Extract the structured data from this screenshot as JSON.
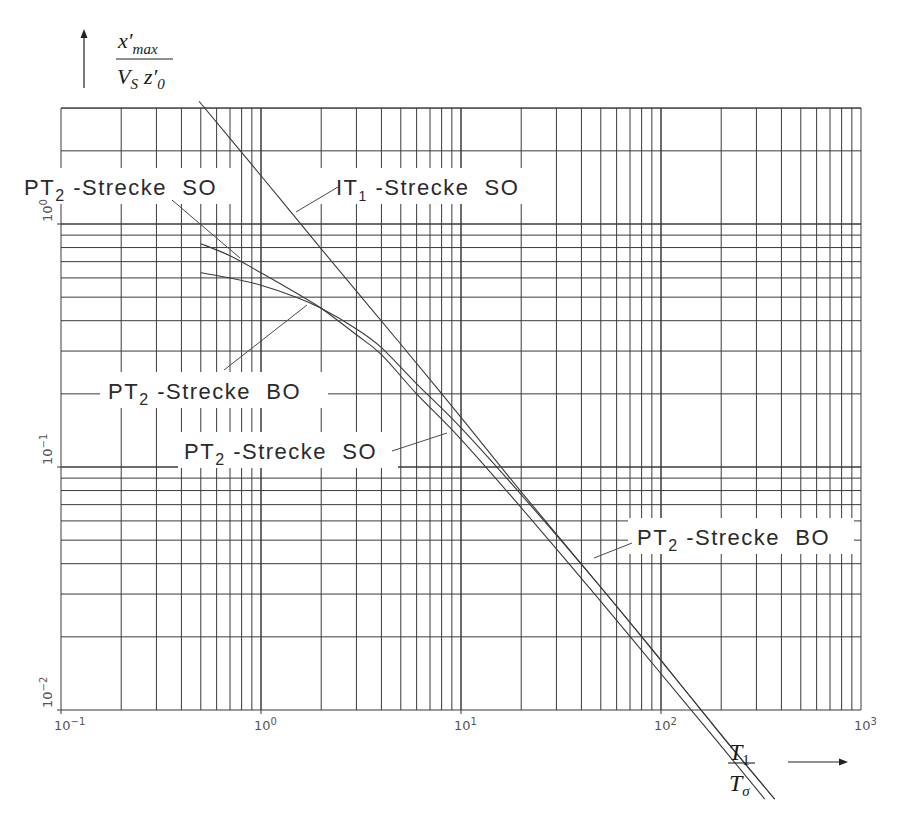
{
  "chart_data": {
    "type": "line",
    "title": "",
    "xscale": "log",
    "yscale": "log",
    "xlim": [
      0.1,
      1000
    ],
    "ylim": [
      0.01,
      3
    ],
    "grid": true,
    "xlabel": "T1 / Tσ",
    "ylabel": "x'max / (VS z'0)",
    "xlabel_parts": {
      "num": "T",
      "num_sub": "1",
      "den": "T",
      "den_sub": "σ"
    },
    "ylabel_parts": {
      "num": "x′",
      "num_sub": "max",
      "den_a": "V",
      "den_a_sub": "S",
      "den_b": "z′",
      "den_b_sub": "0"
    },
    "x_ticks": [
      {
        "base": "10",
        "exp": "−1",
        "value": 0.1
      },
      {
        "base": "10",
        "exp": "0",
        "value": 1
      },
      {
        "base": "10",
        "exp": "1",
        "value": 10
      },
      {
        "base": "10",
        "exp": "2",
        "value": 100
      },
      {
        "base": "10",
        "exp": "3",
        "value": 1000
      }
    ],
    "y_ticks": [
      {
        "base": "10",
        "exp": "−2",
        "value": 0.01
      },
      {
        "base": "10",
        "exp": "−1",
        "value": 0.1
      },
      {
        "base": "10",
        "exp": "0",
        "value": 1
      }
    ],
    "series": [
      {
        "name": "IT1-Strecke SO",
        "label_main": "IT",
        "label_sub": "1",
        "label_rest": " -Strecke  SO",
        "x": [
          0.49,
          1,
          2,
          5,
          10,
          20,
          50,
          100,
          200,
          370
        ],
        "y": [
          3.2,
          1.58,
          0.79,
          0.32,
          0.16,
          0.079,
          0.032,
          0.016,
          0.0079,
          0.0043
        ]
      },
      {
        "name": "PT2-Strecke SO",
        "label_main": "PT",
        "label_sub": "2",
        "label_rest": " -Strecke  SO",
        "x": [
          0.5,
          0.7,
          1,
          1.5,
          2,
          3,
          4,
          6,
          10,
          20,
          50,
          100,
          200,
          330
        ],
        "y": [
          0.83,
          0.74,
          0.63,
          0.52,
          0.45,
          0.35,
          0.29,
          0.2,
          0.13,
          0.068,
          0.028,
          0.0141,
          0.0071,
          0.0043
        ]
      },
      {
        "name": "PT2-Strecke BO",
        "label_main": "PT",
        "label_sub": "2",
        "label_rest": " -Strecke  BO",
        "x": [
          0.5,
          0.7,
          1,
          1.5,
          2,
          3,
          4,
          6,
          10,
          20,
          50,
          100,
          200,
          370
        ],
        "y": [
          0.63,
          0.6,
          0.56,
          0.5,
          0.45,
          0.37,
          0.31,
          0.22,
          0.145,
          0.077,
          0.032,
          0.016,
          0.0079,
          0.0043
        ]
      }
    ],
    "annotations": [
      {
        "text": "PT2 -Strecke SO",
        "target": "PT2-Strecke SO (upper branch)"
      },
      {
        "text": "IT1 -Strecke SO",
        "target": "IT1-Strecke SO"
      },
      {
        "text": "PT2 -Strecke BO",
        "target": "PT2-Strecke BO (upper branch)"
      },
      {
        "text": "PT2 -Strecke SO",
        "target": "PT2-Strecke SO (asymptote region)"
      },
      {
        "text": "PT2 -Strecke BO",
        "target": "PT2-Strecke BO (lower region)"
      }
    ]
  },
  "labels": {
    "top_left": {
      "main": "PT",
      "sub": "2",
      "rest": " -Strecke  SO"
    },
    "it1": {
      "main": "IT",
      "sub": "1",
      "rest": " -Strecke  SO"
    },
    "mid_bo": {
      "main": "PT",
      "sub": "2",
      "rest": " -Strecke  BO"
    },
    "mid_so": {
      "main": "PT",
      "sub": "2",
      "rest": " -Strecke  SO"
    },
    "right_bo": {
      "main": "PT",
      "sub": "2",
      "rest": " -Strecke  BO"
    }
  }
}
